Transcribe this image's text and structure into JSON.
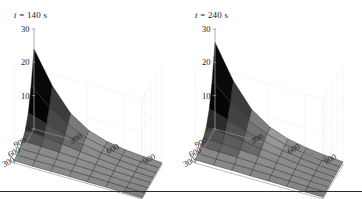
{
  "figure": {
    "background": "#ffffff",
    "separator_color": "#2b2b2b",
    "panel_count": 2
  },
  "panels": [
    {
      "id": "panel-left",
      "title": "t = 140 s",
      "title_symbol": "t",
      "title_value": "140",
      "title_unit": "s"
    },
    {
      "id": "panel-right",
      "title": "t = 240 s",
      "title_symbol": "t",
      "title_value": "240",
      "title_unit": "s"
    }
  ],
  "chart_data": [
    {
      "type": "surface",
      "title": "t = 140 s",
      "xlabel": "",
      "ylabel": "",
      "zlabel": "",
      "grid": true,
      "legend": null,
      "x": [
        0,
        150,
        300,
        450,
        600,
        750,
        900,
        1050
      ],
      "y": [
        0,
        150,
        300,
        450,
        600,
        750,
        900,
        1050
      ],
      "xticks": [
        300,
        600,
        900
      ],
      "yticks": [
        300,
        600,
        900
      ],
      "zticks": [
        0,
        10,
        20,
        30
      ],
      "xlim": [
        0,
        1050
      ],
      "ylim": [
        0,
        1050
      ],
      "zlim": [
        0,
        30
      ],
      "xtick_labels": [
        "300",
        "600",
        "900"
      ],
      "ytick_labels": [
        "900",
        "600",
        "300"
      ],
      "ztick_labels": [
        "0",
        "10",
        "20",
        "30"
      ],
      "colormap": "gray",
      "z": [
        [
          24.0,
          14.5,
          7.8,
          4.2,
          2.4,
          1.5,
          1.0,
          0.7
        ],
        [
          14.5,
          9.6,
          6.0,
          3.6,
          2.2,
          1.4,
          0.9,
          0.6
        ],
        [
          7.8,
          6.0,
          4.4,
          3.0,
          2.0,
          1.3,
          0.9,
          0.6
        ],
        [
          4.2,
          3.6,
          3.0,
          2.3,
          1.7,
          1.2,
          0.8,
          0.6
        ],
        [
          2.4,
          2.2,
          2.0,
          1.7,
          1.4,
          1.0,
          0.8,
          0.5
        ],
        [
          1.5,
          1.4,
          1.3,
          1.2,
          1.0,
          0.8,
          0.6,
          0.5
        ],
        [
          1.0,
          0.9,
          0.9,
          0.8,
          0.8,
          0.6,
          0.5,
          0.4
        ],
        [
          0.7,
          0.6,
          0.6,
          0.6,
          0.5,
          0.5,
          0.4,
          0.3
        ]
      ]
    },
    {
      "type": "surface",
      "title": "t = 240 s",
      "xlabel": "",
      "ylabel": "",
      "zlabel": "",
      "grid": true,
      "legend": null,
      "x": [
        0,
        150,
        300,
        450,
        600,
        750,
        900,
        1050
      ],
      "y": [
        0,
        150,
        300,
        450,
        600,
        750,
        900,
        1050
      ],
      "xticks": [
        300,
        600,
        900
      ],
      "yticks": [
        300,
        600,
        900
      ],
      "zticks": [
        0,
        10,
        20,
        30
      ],
      "xlim": [
        0,
        1050
      ],
      "ylim": [
        0,
        1050
      ],
      "zlim": [
        0,
        30
      ],
      "xtick_labels": [
        "300",
        "600",
        "900"
      ],
      "ytick_labels": [
        "900",
        "600",
        "300"
      ],
      "ztick_labels": [
        "0",
        "10",
        "20",
        "30"
      ],
      "colormap": "gray",
      "z": [
        [
          26.0,
          16.0,
          9.0,
          5.2,
          3.2,
          2.1,
          1.4,
          1.0
        ],
        [
          16.0,
          11.0,
          7.2,
          4.6,
          3.0,
          2.0,
          1.3,
          0.9
        ],
        [
          9.0,
          7.2,
          5.4,
          3.9,
          2.7,
          1.9,
          1.3,
          0.9
        ],
        [
          5.2,
          4.6,
          3.9,
          3.1,
          2.4,
          1.7,
          1.2,
          0.8
        ],
        [
          3.2,
          3.0,
          2.7,
          2.4,
          1.9,
          1.5,
          1.1,
          0.8
        ],
        [
          2.1,
          2.0,
          1.9,
          1.7,
          1.5,
          1.2,
          0.9,
          0.7
        ],
        [
          1.4,
          1.3,
          1.3,
          1.2,
          1.1,
          0.9,
          0.8,
          0.6
        ],
        [
          1.0,
          0.9,
          0.9,
          0.8,
          0.8,
          0.7,
          0.6,
          0.5
        ]
      ]
    }
  ]
}
